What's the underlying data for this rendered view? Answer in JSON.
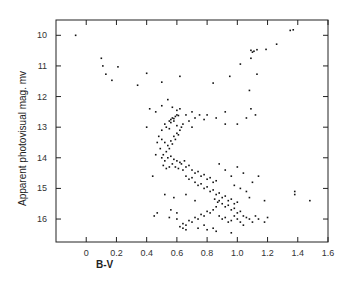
{
  "chart_data": {
    "type": "scatter",
    "title": "",
    "xlabel": "B-V",
    "ylabel": "Apparent photovisual mag. mv",
    "xlim": [
      -0.2,
      1.6
    ],
    "ylim": [
      16.75,
      9.5
    ],
    "y_inverted": true,
    "grid": false,
    "legend": null,
    "x_ticks": [
      0,
      0.2,
      0.4,
      0.6,
      0.8,
      1.0,
      1.2,
      1.4,
      1.6
    ],
    "x_tick_labels": [
      "0",
      "0.2",
      "0.4",
      "0.6",
      "0.8",
      "1.0",
      "1.2",
      "1.4",
      "1.6"
    ],
    "y_ticks": [
      10,
      11,
      12,
      13,
      14,
      15,
      16
    ],
    "y_tick_labels": [
      "10",
      "11",
      "12",
      "13",
      "14",
      "15",
      "16"
    ],
    "series": [
      {
        "name": "stars",
        "points": [
          [
            -0.07,
            10.0
          ],
          [
            0.1,
            10.75
          ],
          [
            0.11,
            11.0
          ],
          [
            0.21,
            11.03
          ],
          [
            0.13,
            11.27
          ],
          [
            0.17,
            11.47
          ],
          [
            0.4,
            11.24
          ],
          [
            0.62,
            11.34
          ],
          [
            0.34,
            11.63
          ],
          [
            0.5,
            11.53
          ],
          [
            0.84,
            11.56
          ],
          [
            0.95,
            11.34
          ],
          [
            1.02,
            10.94
          ],
          [
            1.09,
            10.49
          ],
          [
            1.1,
            10.55
          ],
          [
            1.11,
            10.52
          ],
          [
            1.13,
            10.47
          ],
          [
            1.09,
            10.75
          ],
          [
            1.13,
            11.27
          ],
          [
            1.19,
            10.46
          ],
          [
            1.26,
            10.29
          ],
          [
            1.35,
            9.84
          ],
          [
            1.37,
            9.82
          ],
          [
            1.08,
            11.8
          ],
          [
            0.92,
            12.5
          ],
          [
            1.0,
            12.9
          ],
          [
            1.06,
            12.7
          ],
          [
            1.09,
            12.4
          ],
          [
            1.12,
            12.6
          ],
          [
            1.38,
            15.1
          ],
          [
            1.38,
            15.2
          ],
          [
            1.48,
            15.4
          ],
          [
            0.5,
            12.3
          ],
          [
            0.54,
            12.1
          ],
          [
            0.57,
            12.35
          ],
          [
            0.6,
            12.45
          ],
          [
            0.62,
            12.4
          ],
          [
            0.66,
            12.6
          ],
          [
            0.7,
            12.5
          ],
          [
            0.75,
            12.6
          ],
          [
            0.8,
            12.6
          ],
          [
            0.86,
            12.7
          ],
          [
            0.92,
            12.9
          ],
          [
            0.7,
            13.0
          ],
          [
            0.46,
            12.5
          ],
          [
            0.42,
            12.4
          ],
          [
            0.55,
            12.8
          ],
          [
            0.56,
            12.75
          ],
          [
            0.57,
            12.7
          ],
          [
            0.58,
            12.72
          ],
          [
            0.59,
            12.65
          ],
          [
            0.6,
            12.6
          ],
          [
            0.61,
            12.62
          ],
          [
            0.56,
            12.85
          ],
          [
            0.58,
            12.8
          ],
          [
            0.52,
            12.9
          ],
          [
            0.53,
            13.0
          ],
          [
            0.5,
            13.1
          ],
          [
            0.55,
            13.05
          ],
          [
            0.6,
            12.95
          ],
          [
            0.64,
            12.9
          ],
          [
            0.68,
            12.8
          ],
          [
            0.72,
            12.7
          ],
          [
            0.78,
            12.75
          ],
          [
            0.48,
            13.3
          ],
          [
            0.5,
            13.4
          ],
          [
            0.52,
            13.5
          ],
          [
            0.54,
            13.6
          ],
          [
            0.56,
            13.45
          ],
          [
            0.58,
            13.3
          ],
          [
            0.6,
            13.2
          ],
          [
            0.62,
            13.1
          ],
          [
            0.63,
            13.0
          ],
          [
            0.61,
            13.25
          ],
          [
            0.59,
            13.4
          ],
          [
            0.57,
            13.55
          ],
          [
            0.55,
            13.7
          ],
          [
            0.53,
            13.8
          ],
          [
            0.51,
            13.9
          ],
          [
            0.49,
            13.7
          ],
          [
            0.47,
            13.5
          ],
          [
            0.46,
            13.9
          ],
          [
            0.5,
            14.0
          ],
          [
            0.52,
            14.1
          ],
          [
            0.54,
            14.0
          ],
          [
            0.56,
            13.95
          ],
          [
            0.58,
            14.05
          ],
          [
            0.6,
            14.1
          ],
          [
            0.62,
            14.15
          ],
          [
            0.63,
            14.2
          ],
          [
            0.65,
            14.1
          ],
          [
            0.57,
            14.2
          ],
          [
            0.55,
            14.3
          ],
          [
            0.53,
            14.35
          ],
          [
            0.51,
            14.25
          ],
          [
            0.59,
            14.3
          ],
          [
            0.61,
            14.35
          ],
          [
            0.64,
            14.4
          ],
          [
            0.66,
            14.3
          ],
          [
            0.68,
            14.25
          ],
          [
            0.7,
            14.4
          ],
          [
            0.72,
            14.5
          ],
          [
            0.74,
            14.45
          ],
          [
            0.76,
            14.6
          ],
          [
            0.78,
            14.55
          ],
          [
            0.8,
            14.7
          ],
          [
            0.82,
            14.65
          ],
          [
            0.84,
            14.8
          ],
          [
            0.86,
            14.75
          ],
          [
            0.66,
            14.6
          ],
          [
            0.68,
            14.7
          ],
          [
            0.7,
            14.65
          ],
          [
            0.72,
            14.8
          ],
          [
            0.74,
            14.9
          ],
          [
            0.76,
            14.85
          ],
          [
            0.78,
            15.0
          ],
          [
            0.8,
            14.95
          ],
          [
            0.82,
            15.1
          ],
          [
            0.84,
            15.05
          ],
          [
            0.86,
            15.2
          ],
          [
            0.88,
            15.15
          ],
          [
            0.9,
            15.3
          ],
          [
            0.92,
            15.25
          ],
          [
            0.94,
            15.4
          ],
          [
            0.96,
            15.35
          ],
          [
            0.98,
            15.5
          ],
          [
            1.0,
            15.45
          ],
          [
            0.88,
            15.4
          ],
          [
            0.9,
            15.5
          ],
          [
            0.92,
            15.6
          ],
          [
            0.94,
            15.55
          ],
          [
            0.96,
            15.7
          ],
          [
            0.98,
            15.65
          ],
          [
            1.0,
            15.8
          ],
          [
            1.02,
            15.75
          ],
          [
            1.04,
            15.9
          ],
          [
            0.86,
            15.6
          ],
          [
            0.84,
            15.7
          ],
          [
            0.82,
            15.8
          ],
          [
            0.8,
            15.75
          ],
          [
            0.78,
            15.9
          ],
          [
            0.76,
            15.85
          ],
          [
            0.74,
            16.0
          ],
          [
            0.72,
            15.95
          ],
          [
            0.7,
            16.1
          ],
          [
            0.68,
            16.05
          ],
          [
            0.66,
            16.2
          ],
          [
            0.64,
            16.15
          ],
          [
            0.62,
            16.25
          ],
          [
            0.64,
            16.3
          ],
          [
            0.66,
            16.35
          ],
          [
            0.74,
            16.3
          ],
          [
            0.78,
            16.2
          ],
          [
            0.84,
            16.3
          ],
          [
            0.88,
            15.9
          ],
          [
            0.9,
            16.0
          ],
          [
            0.92,
            15.95
          ],
          [
            0.94,
            16.1
          ],
          [
            0.96,
            16.05
          ],
          [
            0.98,
            15.9
          ],
          [
            1.0,
            16.0
          ],
          [
            1.02,
            16.1
          ],
          [
            1.04,
            16.2
          ],
          [
            1.06,
            15.95
          ],
          [
            1.08,
            16.0
          ],
          [
            1.1,
            16.1
          ],
          [
            1.12,
            15.9
          ],
          [
            1.14,
            16.0
          ],
          [
            1.2,
            15.95
          ],
          [
            0.47,
            15.8
          ],
          [
            0.56,
            15.7
          ],
          [
            0.6,
            15.8
          ],
          [
            0.88,
            14.2
          ],
          [
            0.92,
            14.4
          ],
          [
            0.96,
            14.6
          ],
          [
            1.0,
            14.3
          ],
          [
            1.04,
            14.5
          ],
          [
            0.98,
            14.9
          ],
          [
            1.02,
            15.0
          ],
          [
            1.06,
            15.1
          ],
          [
            1.08,
            15.3
          ],
          [
            1.1,
            14.8
          ],
          [
            1.14,
            14.6
          ],
          [
            1.18,
            15.4
          ],
          [
            0.4,
            13.0
          ],
          [
            0.44,
            14.6
          ],
          [
            0.52,
            15.2
          ],
          [
            0.58,
            15.3
          ],
          [
            0.66,
            15.2
          ],
          [
            0.72,
            15.4
          ],
          [
            0.45,
            15.9
          ],
          [
            0.55,
            15.95
          ],
          [
            0.6,
            16.0
          ],
          [
            0.8,
            16.35
          ],
          [
            0.86,
            16.4
          ],
          [
            0.96,
            16.45
          ],
          [
            1.18,
            16.1
          ],
          [
            0.85,
            15.35
          ],
          [
            0.87,
            15.45
          ]
        ]
      }
    ]
  }
}
